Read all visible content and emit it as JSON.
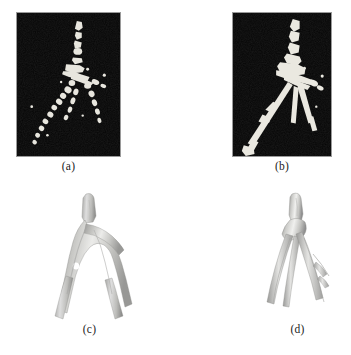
{
  "figure": {
    "background_color": "#ffffff",
    "caption_color": "#1b1b1b",
    "layout": "2x2 grid of panels, each with a caption centered beneath it",
    "panels": [
      {
        "id": "panel-a",
        "caption": "(a)",
        "type": "mra-angiography",
        "description": "Maximum intensity projection of an MRA image showing a fragmented, noisy vessel segmentation of a bifurcating artery tree on a dark background",
        "background_color": "#050505",
        "vessel_color": "#e8e6de",
        "border_color": "#9a9a9a",
        "continuity": "fragmented",
        "x": 16,
        "y": 12,
        "width": 105,
        "height": 145
      },
      {
        "id": "panel-b",
        "caption": "(b)",
        "type": "mra-angiography",
        "description": "Maximum intensity projection of an MRA image showing a more continuous vessel segmentation of the same bifurcating artery tree on a dark background",
        "background_color": "#050505",
        "vessel_color": "#eae8e0",
        "border_color": "#9a9a9a",
        "continuity": "continuous",
        "x": 232,
        "y": 12,
        "width": 100,
        "height": 145
      },
      {
        "id": "panel-c",
        "caption": "(c)",
        "type": "surface-rendering",
        "description": "Three dimensional shaded surface reconstruction of the vessel tree in which the two main branches are merged into a single webbed sheet, with a small hole near the bifurcation",
        "background_color": "#ffffff",
        "surface_color": "#c9c9c5",
        "surface_shadow_color": "#8f8f8d",
        "surface_highlight_color": "#efefed",
        "branch_style": "merged-webbed",
        "x": 42,
        "y": 190,
        "width": 95,
        "height": 130
      },
      {
        "id": "panel-d",
        "caption": "(d)",
        "type": "surface-rendering",
        "description": "Three dimensional shaded surface reconstruction of the vessel tree in which the branches are resolved as separate thin tubular vessels",
        "background_color": "#ffffff",
        "surface_color": "#cfcfcb",
        "surface_shadow_color": "#909090",
        "surface_highlight_color": "#f2f2f0",
        "branch_style": "separated-tubular",
        "x": 250,
        "y": 190,
        "width": 95,
        "height": 130
      }
    ],
    "captions": {
      "a": "(a)",
      "b": "(b)",
      "c": "(c)",
      "d": "(d)"
    }
  }
}
